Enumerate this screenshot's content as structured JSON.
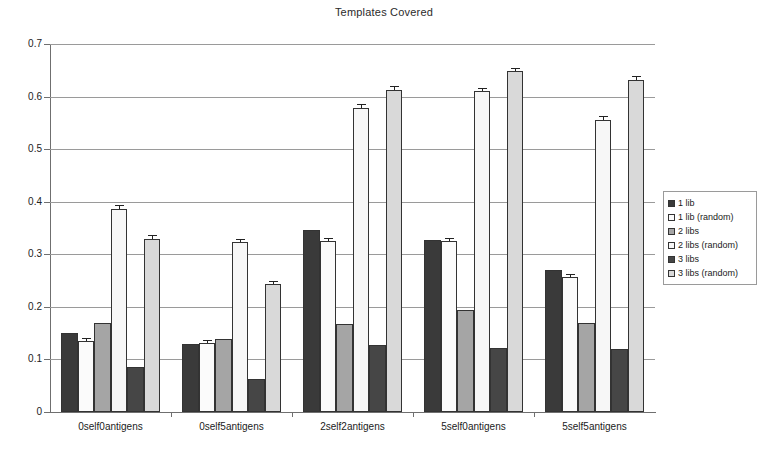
{
  "chart_data": {
    "type": "bar",
    "title": "Templates Covered",
    "xlabel": "",
    "ylabel": "",
    "ylim": [
      0,
      0.7
    ],
    "yticks": [
      "0",
      "0.1",
      "0.2",
      "0.3",
      "0.4",
      "0.5",
      "0.6",
      "0.7"
    ],
    "ytick_values": [
      0,
      0.1,
      0.2,
      0.3,
      0.4,
      0.5,
      0.6,
      0.7
    ],
    "grid": true,
    "legend_position": "right",
    "categories": [
      "0self0antigens",
      "0self5antigens",
      "2self2antigens",
      "5self0antigens",
      "5self5antigens"
    ],
    "series": [
      {
        "name": "1 lib",
        "color": "#3a3a3a",
        "values": [
          0.15,
          0.13,
          0.347,
          0.327,
          0.27
        ],
        "errors": [
          0.0,
          0.0,
          0.0,
          0.0,
          0.0
        ]
      },
      {
        "name": "1 lib (random)",
        "color": "#fbfbfb",
        "values": [
          0.135,
          0.132,
          0.325,
          0.326,
          0.257
        ],
        "errors": [
          0.003,
          0.003,
          0.004,
          0.003,
          0.004
        ]
      },
      {
        "name": "2 libs",
        "color": "#a5a5a5",
        "values": [
          0.17,
          0.138,
          0.167,
          0.195,
          0.17
        ],
        "errors": [
          0.0,
          0.0,
          0.0,
          0.0,
          0.0
        ]
      },
      {
        "name": "2 libs (random)",
        "color": "#f7f7f7",
        "values": [
          0.386,
          0.323,
          0.578,
          0.61,
          0.555
        ],
        "errors": [
          0.005,
          0.004,
          0.006,
          0.005,
          0.006
        ]
      },
      {
        "name": "3 libs",
        "color": "#464646",
        "values": [
          0.085,
          0.062,
          0.127,
          0.121,
          0.119
        ],
        "errors": [
          0.0,
          0.0,
          0.0,
          0.0,
          0.0
        ]
      },
      {
        "name": "3 libs (random)",
        "color": "#d9d9d9",
        "values": [
          0.33,
          0.243,
          0.613,
          0.648,
          0.632
        ],
        "errors": [
          0.005,
          0.004,
          0.005,
          0.004,
          0.005
        ]
      }
    ]
  },
  "legend": {
    "items": [
      {
        "label": "1 lib",
        "swatch": "#3a3a3a"
      },
      {
        "label": "1 lib (random)",
        "swatch": "#fbfbfb"
      },
      {
        "label": "2 libs",
        "swatch": "#a5a5a5"
      },
      {
        "label": "2 libs (random)",
        "swatch": "#f7f7f7"
      },
      {
        "label": "3 libs",
        "swatch": "#464646"
      },
      {
        "label": "3 libs (random)",
        "swatch": "#d9d9d9"
      }
    ]
  }
}
